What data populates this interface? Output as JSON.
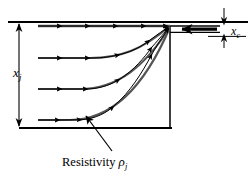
{
  "figure": {
    "colors": {
      "line": "#000000",
      "background": "#ffffff",
      "flow_line": "#1a1a1a"
    },
    "labels": {
      "junction_depth": {
        "symbol": "x",
        "subscript": "j",
        "text": "x_j"
      },
      "contact_depth": {
        "symbol": "x",
        "subscript": "c",
        "text": "x_c"
      },
      "resistivity": {
        "prefix": "Resistivity ",
        "symbol": "ρ",
        "subscript": "j",
        "text": "Resistivity ρ_j"
      }
    },
    "geometry": {
      "surface_line": {
        "x1": 8,
        "y1": 22,
        "x2": 248,
        "y2": 22
      },
      "bottom_line": {
        "x1": 19,
        "y1": 128,
        "x2": 172,
        "y2": 128
      },
      "junction_edge": {
        "x1": 170,
        "y1": 27,
        "x2": 170,
        "y2": 128
      },
      "convergence_point": {
        "x": 170,
        "y": 26
      },
      "dimension_xj": {
        "x": 19,
        "y_top": 23,
        "y_bottom": 127
      },
      "dimension_xc": {
        "x": 224,
        "y_top": 14,
        "y_bottom": 36
      },
      "contact_bar": {
        "x1": 176,
        "y1": 27,
        "x2": 218,
        "y2": 31
      },
      "leader_arrow": {
        "x1": 110,
        "y1": 152,
        "x2": 85,
        "y2": 117
      }
    },
    "flow_lines": [
      {
        "name": "flow-line-surface",
        "depth_label": "surface",
        "path": "M 38 26 L 170 26",
        "arrow_markers": [
          0.12,
          0.34,
          0.56,
          0.78,
          0.95
        ]
      },
      {
        "name": "flow-line-shallow",
        "depth_label": "shallow",
        "path": "M 38 58 L 90 58 C 120 58 142 50 170 26",
        "arrow_markers": [
          0.1,
          0.3,
          0.55,
          0.8,
          0.95
        ]
      },
      {
        "name": "flow-line-middle",
        "depth_label": "middle",
        "path": "M 38 89 L 80 89 C 118 89 145 66 170 27",
        "arrow_markers": [
          0.1,
          0.3,
          0.55,
          0.8,
          0.95
        ]
      },
      {
        "name": "flow-line-deep",
        "depth_label": "deep",
        "path": "M 38 120 L 70 120 C 112 120 145 86 170 27",
        "arrow_markers": [
          0.1,
          0.32,
          0.58,
          0.82,
          0.96
        ]
      }
    ]
  }
}
